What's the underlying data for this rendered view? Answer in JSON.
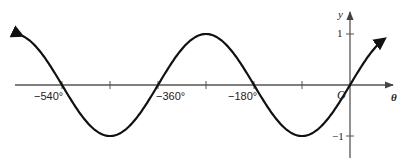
{
  "chart_data": {
    "type": "line",
    "title": "",
    "function": "y = sin θ",
    "xlabel": "θ",
    "ylabel": "y",
    "origin_label": "O",
    "x_unit": "degrees",
    "xlim": [
      -615,
      65
    ],
    "ylim": [
      -1,
      1
    ],
    "x_ticks": [
      -540,
      -450,
      -360,
      -270,
      -180,
      -90,
      0
    ],
    "x_tick_labels": [
      {
        "value": -540,
        "label": "−540°"
      },
      {
        "value": -360,
        "label": "−360°"
      },
      {
        "value": -180,
        "label": "−180°"
      }
    ],
    "y_ticks": [
      {
        "value": 1,
        "label": "1"
      },
      {
        "value": -1,
        "label": "−1"
      }
    ],
    "grid": false,
    "legend": null,
    "series": [
      {
        "name": "sin θ",
        "x": [
          -615,
          -540,
          -450,
          -360,
          -270,
          -180,
          -90,
          0,
          62
        ],
        "values": [
          -0.97,
          0,
          -1,
          0,
          1,
          0,
          -1,
          0,
          0.88
        ],
        "arrows_at_ends": true
      }
    ]
  },
  "labels": {
    "x540": "−540°",
    "x360": "−360°",
    "x180": "−180°",
    "y1": "1",
    "yneg1": "−1",
    "ylabel": "y",
    "xlabel": "θ",
    "origin": "O"
  }
}
